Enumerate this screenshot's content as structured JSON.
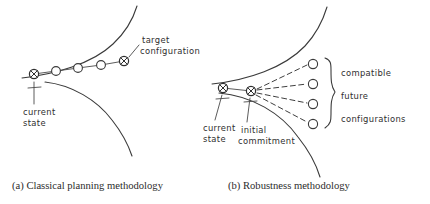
{
  "figure": {
    "panels": [
      {
        "id": "a",
        "caption": "(a) Classical planning methodology",
        "annotations": {
          "target_line1": "target",
          "target_line2": "configuration",
          "current_line1": "current",
          "current_line2": "state"
        },
        "nodes": [
          {
            "type": "crossed-circle",
            "x": 34,
            "y": 74,
            "role": "current-state"
          },
          {
            "type": "open-circle",
            "x": 56,
            "y": 71,
            "role": "intermediate-step"
          },
          {
            "type": "open-circle",
            "x": 78,
            "y": 68,
            "role": "intermediate-step"
          },
          {
            "type": "open-circle",
            "x": 101,
            "y": 65,
            "role": "intermediate-step"
          },
          {
            "type": "crossed-circle",
            "x": 124,
            "y": 61,
            "role": "target-configuration"
          }
        ]
      },
      {
        "id": "b",
        "caption": "(b) Robustness methodology",
        "annotations": {
          "current_line1": "current",
          "current_line2": "state",
          "initial_line1": "initial",
          "initial_line2": "commitment",
          "brace_line1": "compatible",
          "brace_line2": "future",
          "brace_line3": "configurations"
        },
        "nodes": [
          {
            "type": "crossed-circle",
            "x": 223,
            "y": 88,
            "role": "current-state"
          },
          {
            "type": "crossed-circle",
            "x": 251,
            "y": 91,
            "role": "initial-commitment"
          },
          {
            "type": "open-circle",
            "x": 313,
            "y": 64,
            "role": "future-configuration"
          },
          {
            "type": "open-circle",
            "x": 313,
            "y": 84,
            "role": "future-configuration"
          },
          {
            "type": "open-circle",
            "x": 313,
            "y": 104,
            "role": "future-configuration"
          },
          {
            "type": "open-circle",
            "x": 313,
            "y": 124,
            "role": "future-configuration"
          }
        ]
      }
    ],
    "colors": {
      "ink": "#3a3a3a",
      "text": "#2e2e2e",
      "background": "#ffffff"
    }
  }
}
